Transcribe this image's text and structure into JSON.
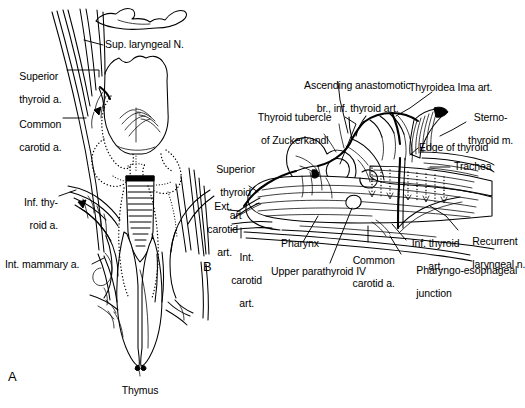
{
  "figure": {
    "background_color": "#ffffff",
    "ink_color": "#000000",
    "type": "anatomical-line-drawing",
    "panels": [
      {
        "letter": "A",
        "description": "Anterior view of larynx, thyroid gland, trachea and thymus with arterial supply"
      },
      {
        "letter": "B",
        "description": "Lateral view of thyroid lobe, pharynx, carotid vessels and recurrent laryngeal nerve"
      }
    ]
  },
  "panel_a": {
    "letter": "A",
    "labels": {
      "sup_laryngeal_n": "Sup. laryngeal N.",
      "superior_thyroid_a_line1": "Superior",
      "superior_thyroid_a_line2": "thyroid a.",
      "common_carotid_a_line1": "Common",
      "common_carotid_a_line2": "carotid a.",
      "inf_thyroid_a_line1": "Inf. thy-",
      "inf_thyroid_a_line2": "roid a.",
      "int_mammary_a": "Int. mammary a.",
      "thymus": "Thymus"
    }
  },
  "panel_b": {
    "letter": "B",
    "labels": {
      "ascending_anastomotic_line1": "Ascending anastomotic",
      "ascending_anastomotic_line2": "br., inf. thyroid art.",
      "thyroidea_ima_art": "Thyroidea Ima art.",
      "sternothyroid_m_line1": "Sterno-",
      "sternothyroid_m_line2": "thyroid m.",
      "thyroid_tubercle_line1": "Thyroid tubercle",
      "thyroid_tubercle_line2": "of Zuckerkandl",
      "edge_of_thyroid": "Edge of thyroid",
      "trachea": "Trachea",
      "superior_thyroid_art_line1": "Superior",
      "superior_thyroid_art_line2": "thyroid",
      "superior_thyroid_art_line3": "art",
      "ext_carotid_art_line1": "Ext.",
      "ext_carotid_art_line2": "carotid",
      "ext_carotid_art_line3": "art.",
      "int_carotid_art_line1": "Int.",
      "int_carotid_art_line2": "carotid",
      "int_carotid_art_line3": "art.",
      "pharynx": "Pharynx",
      "upper_parathyroid_iv": "Upper parathyroid IV",
      "common_carotid_a_line1": "Common",
      "common_carotid_a_line2": "carotid a.",
      "inf_thyroid_art_line1": "Inf. thyroid",
      "inf_thyroid_art_line2": "art.",
      "pharyngo_esophageal_line1": "Pharyngo-esophageal",
      "pharyngo_esophageal_line2": "junction",
      "recurrent_laryngeal_n_line1": "Recurrent",
      "recurrent_laryngeal_n_line2": "laryngeal n."
    }
  }
}
